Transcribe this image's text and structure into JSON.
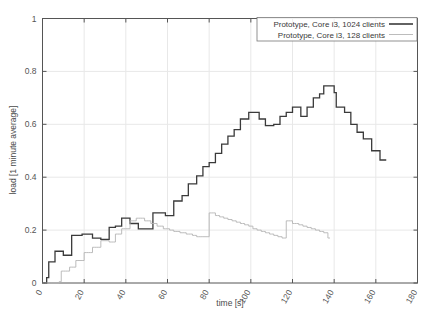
{
  "chart_data": {
    "type": "line",
    "title": "",
    "xlabel": "time [s]",
    "ylabel": "load [1 minute average]",
    "xlim": [
      0,
      180
    ],
    "ylim": [
      0,
      1
    ],
    "xticks": [
      0,
      20,
      40,
      60,
      80,
      100,
      120,
      140,
      160,
      180
    ],
    "yticks": [
      0,
      0.2,
      0.4,
      0.6,
      0.8,
      1
    ],
    "xtick_labels": [
      "0",
      "20",
      "40",
      "60",
      "80",
      "100",
      "120",
      "140",
      "160",
      "180"
    ],
    "ytick_labels": [
      "0",
      "0.2",
      "0.4",
      "0.6",
      "0.8",
      "1"
    ],
    "grid": true,
    "legend_position": "top-right",
    "series": [
      {
        "name": "Prototype, Core i3, 1024 clients",
        "color": "#3a3a3a",
        "width": 1.3,
        "points": [
          [
            0,
            0.0
          ],
          [
            1,
            0.0
          ],
          [
            2,
            0.02
          ],
          [
            3,
            0.08
          ],
          [
            4,
            0.08
          ],
          [
            5,
            0.08
          ],
          [
            6,
            0.12
          ],
          [
            7,
            0.12
          ],
          [
            8,
            0.12
          ],
          [
            9,
            0.12
          ],
          [
            10,
            0.105
          ],
          [
            11,
            0.105
          ],
          [
            12,
            0.105
          ],
          [
            13,
            0.105
          ],
          [
            14,
            0.18
          ],
          [
            15,
            0.18
          ],
          [
            16,
            0.18
          ],
          [
            17,
            0.18
          ],
          [
            18,
            0.18
          ],
          [
            19,
            0.185
          ],
          [
            20,
            0.185
          ],
          [
            21,
            0.185
          ],
          [
            22,
            0.185
          ],
          [
            23,
            0.185
          ],
          [
            24,
            0.17
          ],
          [
            25,
            0.17
          ],
          [
            26,
            0.17
          ],
          [
            27,
            0.17
          ],
          [
            28,
            0.165
          ],
          [
            29,
            0.165
          ],
          [
            30,
            0.165
          ],
          [
            31,
            0.165
          ],
          [
            32,
            0.21
          ],
          [
            33,
            0.21
          ],
          [
            34,
            0.21
          ],
          [
            35,
            0.215
          ],
          [
            36,
            0.215
          ],
          [
            37,
            0.215
          ],
          [
            38,
            0.245
          ],
          [
            39,
            0.245
          ],
          [
            40,
            0.245
          ],
          [
            41,
            0.245
          ],
          [
            42,
            0.225
          ],
          [
            43,
            0.225
          ],
          [
            44,
            0.225
          ],
          [
            45,
            0.225
          ],
          [
            46,
            0.205
          ],
          [
            47,
            0.205
          ],
          [
            48,
            0.205
          ],
          [
            49,
            0.205
          ],
          [
            50,
            0.205
          ],
          [
            51,
            0.205
          ],
          [
            52,
            0.205
          ],
          [
            53,
            0.265
          ],
          [
            54,
            0.265
          ],
          [
            55,
            0.265
          ],
          [
            56,
            0.265
          ],
          [
            57,
            0.265
          ],
          [
            58,
            0.265
          ],
          [
            59,
            0.255
          ],
          [
            60,
            0.255
          ],
          [
            61,
            0.255
          ],
          [
            62,
            0.255
          ],
          [
            63,
            0.31
          ],
          [
            64,
            0.31
          ],
          [
            65,
            0.31
          ],
          [
            66,
            0.31
          ],
          [
            67,
            0.33
          ],
          [
            68,
            0.33
          ],
          [
            69,
            0.33
          ],
          [
            70,
            0.375
          ],
          [
            71,
            0.375
          ],
          [
            72,
            0.375
          ],
          [
            73,
            0.375
          ],
          [
            74,
            0.405
          ],
          [
            75,
            0.405
          ],
          [
            76,
            0.405
          ],
          [
            77,
            0.44
          ],
          [
            78,
            0.44
          ],
          [
            79,
            0.44
          ],
          [
            80,
            0.455
          ],
          [
            81,
            0.455
          ],
          [
            82,
            0.455
          ],
          [
            83,
            0.49
          ],
          [
            84,
            0.49
          ],
          [
            85,
            0.49
          ],
          [
            86,
            0.525
          ],
          [
            87,
            0.525
          ],
          [
            88,
            0.525
          ],
          [
            89,
            0.555
          ],
          [
            90,
            0.555
          ],
          [
            91,
            0.555
          ],
          [
            92,
            0.58
          ],
          [
            93,
            0.58
          ],
          [
            94,
            0.58
          ],
          [
            95,
            0.62
          ],
          [
            96,
            0.62
          ],
          [
            97,
            0.62
          ],
          [
            98,
            0.62
          ],
          [
            99,
            0.645
          ],
          [
            100,
            0.645
          ],
          [
            101,
            0.645
          ],
          [
            102,
            0.645
          ],
          [
            103,
            0.645
          ],
          [
            104,
            0.62
          ],
          [
            105,
            0.62
          ],
          [
            106,
            0.62
          ],
          [
            107,
            0.595
          ],
          [
            108,
            0.595
          ],
          [
            109,
            0.595
          ],
          [
            110,
            0.595
          ],
          [
            111,
            0.6
          ],
          [
            112,
            0.6
          ],
          [
            113,
            0.6
          ],
          [
            114,
            0.63
          ],
          [
            115,
            0.63
          ],
          [
            116,
            0.63
          ],
          [
            117,
            0.645
          ],
          [
            118,
            0.645
          ],
          [
            119,
            0.645
          ],
          [
            120,
            0.665
          ],
          [
            121,
            0.665
          ],
          [
            122,
            0.665
          ],
          [
            123,
            0.665
          ],
          [
            124,
            0.63
          ],
          [
            125,
            0.63
          ],
          [
            126,
            0.63
          ],
          [
            127,
            0.665
          ],
          [
            128,
            0.665
          ],
          [
            129,
            0.665
          ],
          [
            130,
            0.7
          ],
          [
            131,
            0.7
          ],
          [
            132,
            0.7
          ],
          [
            133,
            0.715
          ],
          [
            134,
            0.715
          ],
          [
            135,
            0.745
          ],
          [
            136,
            0.745
          ],
          [
            137,
            0.745
          ],
          [
            138,
            0.745
          ],
          [
            139,
            0.745
          ],
          [
            140,
            0.72
          ],
          [
            141,
            0.665
          ],
          [
            142,
            0.665
          ],
          [
            143,
            0.665
          ],
          [
            144,
            0.665
          ],
          [
            145,
            0.645
          ],
          [
            146,
            0.645
          ],
          [
            147,
            0.645
          ],
          [
            148,
            0.6
          ],
          [
            149,
            0.6
          ],
          [
            150,
            0.6
          ],
          [
            151,
            0.57
          ],
          [
            152,
            0.57
          ],
          [
            153,
            0.57
          ],
          [
            154,
            0.545
          ],
          [
            155,
            0.545
          ],
          [
            156,
            0.545
          ],
          [
            157,
            0.545
          ],
          [
            158,
            0.5
          ],
          [
            159,
            0.5
          ],
          [
            160,
            0.5
          ],
          [
            161,
            0.5
          ],
          [
            162,
            0.465
          ],
          [
            163,
            0.465
          ],
          [
            164,
            0.465
          ],
          [
            165,
            0.465
          ]
        ]
      },
      {
        "name": "Prototype, Core i3, 128 clients",
        "color": "#b4b4b4",
        "width": 0.9,
        "points": [
          [
            0,
            0.0
          ],
          [
            1,
            0.0
          ],
          [
            2,
            0.0
          ],
          [
            3,
            0.0
          ],
          [
            4,
            0.0
          ],
          [
            5,
            0.0
          ],
          [
            6,
            0.0
          ],
          [
            7,
            0.0
          ],
          [
            8,
            0.005
          ],
          [
            9,
            0.045
          ],
          [
            10,
            0.045
          ],
          [
            11,
            0.045
          ],
          [
            12,
            0.045
          ],
          [
            13,
            0.06
          ],
          [
            14,
            0.06
          ],
          [
            15,
            0.06
          ],
          [
            16,
            0.085
          ],
          [
            17,
            0.085
          ],
          [
            18,
            0.085
          ],
          [
            19,
            0.085
          ],
          [
            20,
            0.115
          ],
          [
            21,
            0.115
          ],
          [
            22,
            0.115
          ],
          [
            23,
            0.115
          ],
          [
            24,
            0.135
          ],
          [
            25,
            0.135
          ],
          [
            26,
            0.135
          ],
          [
            27,
            0.135
          ],
          [
            28,
            0.16
          ],
          [
            29,
            0.16
          ],
          [
            30,
            0.16
          ],
          [
            31,
            0.16
          ],
          [
            32,
            0.155
          ],
          [
            33,
            0.155
          ],
          [
            34,
            0.155
          ],
          [
            35,
            0.185
          ],
          [
            36,
            0.185
          ],
          [
            37,
            0.185
          ],
          [
            38,
            0.205
          ],
          [
            39,
            0.205
          ],
          [
            40,
            0.205
          ],
          [
            41,
            0.205
          ],
          [
            42,
            0.235
          ],
          [
            43,
            0.235
          ],
          [
            44,
            0.235
          ],
          [
            45,
            0.245
          ],
          [
            46,
            0.245
          ],
          [
            47,
            0.245
          ],
          [
            48,
            0.245
          ],
          [
            49,
            0.235
          ],
          [
            50,
            0.235
          ],
          [
            51,
            0.235
          ],
          [
            52,
            0.225
          ],
          [
            53,
            0.225
          ],
          [
            54,
            0.225
          ],
          [
            55,
            0.215
          ],
          [
            56,
            0.215
          ],
          [
            57,
            0.215
          ],
          [
            58,
            0.205
          ],
          [
            59,
            0.205
          ],
          [
            60,
            0.205
          ],
          [
            61,
            0.2
          ],
          [
            62,
            0.2
          ],
          [
            63,
            0.195
          ],
          [
            64,
            0.195
          ],
          [
            65,
            0.195
          ],
          [
            66,
            0.19
          ],
          [
            67,
            0.19
          ],
          [
            68,
            0.19
          ],
          [
            69,
            0.185
          ],
          [
            70,
            0.185
          ],
          [
            71,
            0.185
          ],
          [
            72,
            0.18
          ],
          [
            73,
            0.18
          ],
          [
            74,
            0.175
          ],
          [
            75,
            0.175
          ],
          [
            76,
            0.175
          ],
          [
            77,
            0.175
          ],
          [
            78,
            0.175
          ],
          [
            79,
            0.175
          ],
          [
            80,
            0.265
          ],
          [
            81,
            0.265
          ],
          [
            82,
            0.265
          ],
          [
            83,
            0.255
          ],
          [
            84,
            0.255
          ],
          [
            85,
            0.25
          ],
          [
            86,
            0.25
          ],
          [
            87,
            0.245
          ],
          [
            88,
            0.245
          ],
          [
            89,
            0.24
          ],
          [
            90,
            0.24
          ],
          [
            91,
            0.235
          ],
          [
            92,
            0.235
          ],
          [
            93,
            0.23
          ],
          [
            94,
            0.23
          ],
          [
            95,
            0.225
          ],
          [
            96,
            0.225
          ],
          [
            97,
            0.22
          ],
          [
            98,
            0.22
          ],
          [
            99,
            0.215
          ],
          [
            100,
            0.215
          ],
          [
            101,
            0.205
          ],
          [
            102,
            0.205
          ],
          [
            103,
            0.2
          ],
          [
            104,
            0.2
          ],
          [
            105,
            0.195
          ],
          [
            106,
            0.195
          ],
          [
            107,
            0.19
          ],
          [
            108,
            0.19
          ],
          [
            109,
            0.185
          ],
          [
            110,
            0.185
          ],
          [
            111,
            0.18
          ],
          [
            112,
            0.18
          ],
          [
            113,
            0.175
          ],
          [
            114,
            0.175
          ],
          [
            115,
            0.17
          ],
          [
            116,
            0.17
          ],
          [
            117,
            0.235
          ],
          [
            118,
            0.235
          ],
          [
            119,
            0.235
          ],
          [
            120,
            0.225
          ],
          [
            121,
            0.225
          ],
          [
            122,
            0.225
          ],
          [
            123,
            0.22
          ],
          [
            124,
            0.22
          ],
          [
            125,
            0.215
          ],
          [
            126,
            0.215
          ],
          [
            127,
            0.21
          ],
          [
            128,
            0.21
          ],
          [
            129,
            0.205
          ],
          [
            130,
            0.205
          ],
          [
            131,
            0.2
          ],
          [
            132,
            0.2
          ],
          [
            133,
            0.195
          ],
          [
            134,
            0.195
          ],
          [
            135,
            0.19
          ],
          [
            136,
            0.19
          ],
          [
            137,
            0.17
          ],
          [
            138,
            0.17
          ]
        ]
      }
    ],
    "legend": [
      {
        "label": "Prototype, Core i3, 1024 clients",
        "color": "#3a3a3a",
        "width": 1.6
      },
      {
        "label": "Prototype, Core i3, 128 clients",
        "color": "#b4b4b4",
        "width": 0.9
      }
    ]
  },
  "styling": {
    "background": "#ffffff",
    "frame_color": "#555555",
    "grid_color": "#e8e8e8",
    "text_color": "#4a4a4a"
  }
}
